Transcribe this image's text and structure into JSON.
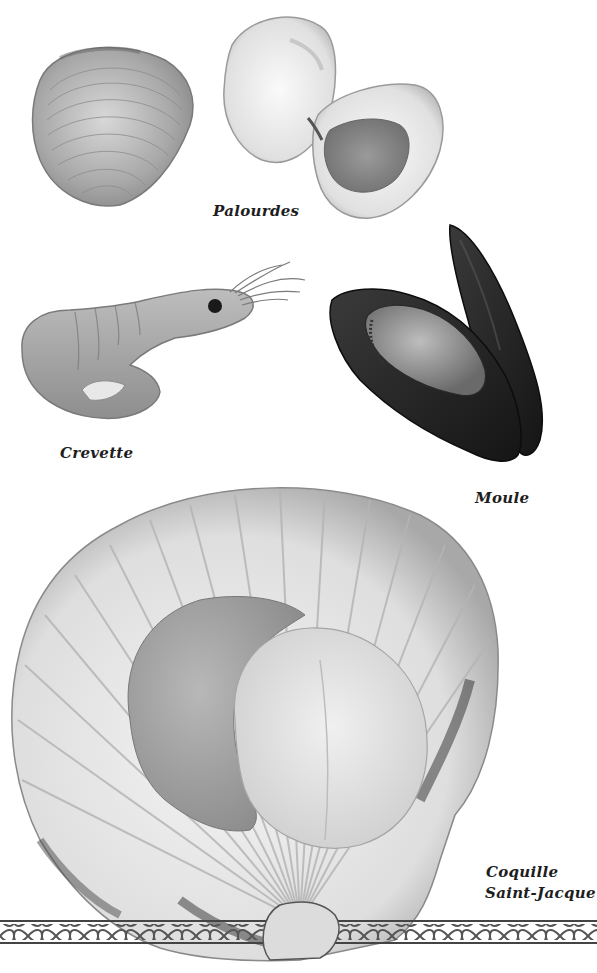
{
  "page": {
    "type": "illustrated book page",
    "background": "#ffffff",
    "ink_color": "#1e1e1e"
  },
  "items": [
    {
      "id": "palourdes",
      "label": "Palourdes",
      "illustration": "clam-icon"
    },
    {
      "id": "crevette",
      "label": "Crevette",
      "illustration": "shrimp-icon"
    },
    {
      "id": "moule",
      "label": "Moule",
      "illustration": "mussel-icon"
    },
    {
      "id": "coquille",
      "label_line1": "Coquille",
      "label_line2": "Saint-Jacque",
      "illustration": "scallop-icon"
    }
  ],
  "decoration": {
    "border": "rope-braid-border-icon"
  }
}
